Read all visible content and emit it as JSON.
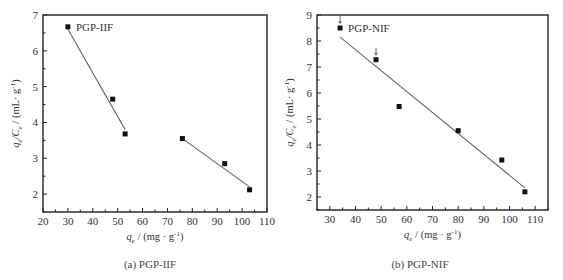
{
  "chart_data": [
    {
      "type": "scatter",
      "panel": "a",
      "title": "",
      "caption": "(a) PGP-IIF",
      "annotation": "PGP-IIF",
      "xlabel": "q_e / (mg·g⁻¹)",
      "ylabel": "q_e/C_e / (mL·g⁻¹)",
      "xlim": [
        20,
        110
      ],
      "ylim": [
        1.5,
        7
      ],
      "xticks": [
        20,
        30,
        40,
        50,
        60,
        70,
        80,
        90,
        100,
        110
      ],
      "yticks": [
        2,
        3,
        4,
        5,
        6,
        7
      ],
      "grid": false,
      "series": [
        {
          "name": "PGP-IIF data",
          "x": [
            30,
            48,
            53,
            76,
            93,
            103
          ],
          "y": [
            6.67,
            4.65,
            3.68,
            3.55,
            2.85,
            2.12
          ]
        }
      ],
      "fit_lines": [
        {
          "x": [
            30,
            53
          ],
          "y": [
            6.6,
            3.8
          ]
        },
        {
          "x": [
            76,
            103
          ],
          "y": [
            3.55,
            2.2
          ]
        }
      ]
    },
    {
      "type": "scatter",
      "panel": "b",
      "title": "",
      "caption": "(b) PGP-NIF",
      "annotation": "PGP-NIF",
      "xlabel": "q_e / (mg·g⁻¹)",
      "ylabel": "q_e/C_e / (mL·g⁻¹)",
      "xlim": [
        25,
        115
      ],
      "ylim": [
        1.5,
        9
      ],
      "xticks": [
        30,
        40,
        50,
        60,
        70,
        80,
        90,
        100,
        110
      ],
      "yticks": [
        2,
        3,
        4,
        5,
        6,
        7,
        8,
        9
      ],
      "grid": false,
      "series": [
        {
          "name": "PGP-NIF data",
          "x": [
            34,
            48,
            57,
            80,
            97,
            106
          ],
          "y": [
            8.5,
            7.28,
            5.48,
            4.55,
            3.42,
            2.2
          ]
        }
      ],
      "fit_lines": [
        {
          "x": [
            34,
            106
          ],
          "y": [
            8.15,
            2.35
          ]
        }
      ],
      "arrows_at_x": [
        34,
        48
      ]
    }
  ],
  "labels": {
    "a": {
      "annotation": "PGP-IIF",
      "caption": "(a) PGP-IIF",
      "xlabel_q": "q",
      "xlabel_sub": "e",
      "xlabel_unit": " / (mg · g",
      "ylabel_text": "q/C / (mL· g⁻¹)",
      "xticks": [
        "20",
        "30",
        "40",
        "50",
        "60",
        "70",
        "80",
        "90",
        "100",
        "110"
      ],
      "yticks": [
        "2",
        "3",
        "4",
        "5",
        "6",
        "7"
      ]
    },
    "b": {
      "annotation": "PGP-NIF",
      "caption": "(b) PGP-NIF",
      "xlabel_q": "q",
      "xlabel_sub": "e",
      "xlabel_unit": " / (mg · g",
      "ylabel_text": "q/C / (mL· g⁻¹)",
      "xticks": [
        "30",
        "40",
        "50",
        "60",
        "70",
        "80",
        "90",
        "100",
        "110"
      ],
      "yticks": [
        "2",
        "3",
        "4",
        "5",
        "6",
        "7",
        "8",
        "9"
      ]
    }
  }
}
